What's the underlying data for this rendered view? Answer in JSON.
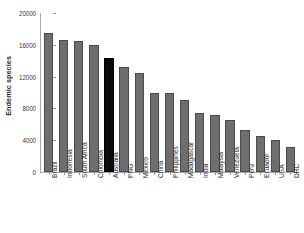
{
  "chart_data": {
    "type": "bar",
    "title": "",
    "xlabel": "",
    "ylabel": "Endemic species",
    "ylim": [
      0,
      20000
    ],
    "yticks": [
      0,
      4000,
      8000,
      12000,
      16000,
      20000
    ],
    "ytick_labels": [
      "0",
      "4000",
      "8000",
      "12000",
      "16000",
      "20000"
    ],
    "grid": false,
    "legend": "none",
    "categories": [
      "Brazil",
      "Indonesia",
      "South Africa",
      "Colombia",
      "Australia",
      "PNG",
      "Mexico",
      "China",
      "Philippines",
      "Madagascar",
      "India",
      "Malaysia",
      "Venezuela",
      "Peru",
      "Ecuador",
      "USA",
      "DRC"
    ],
    "values": [
      17500,
      16600,
      16500,
      16000,
      14400,
      13200,
      12400,
      10000,
      10000,
      9100,
      7400,
      7200,
      6500,
      5300,
      4500,
      4000,
      3100
    ],
    "highlight_index": 4,
    "bar_color": "#6e6e6e",
    "highlight_color": "#0a0a0a",
    "axis_color": "#a8a8a8",
    "text_color": "#2e2e2e"
  }
}
